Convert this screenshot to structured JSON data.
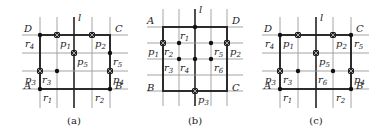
{
  "panels": [
    {
      "caption": "(a)",
      "line_label": "l",
      "corners": [
        {
          "name": "D",
          "at": "top-left"
        },
        {
          "name": "C",
          "at": "top-right"
        },
        {
          "name": "A",
          "at": "bottom-left"
        },
        {
          "name": "B",
          "at": "bottom-right"
        }
      ],
      "grid": {
        "cols": 5,
        "rows": 4,
        "l_col": 2
      },
      "rect": {
        "c0": 0,
        "c1": 4,
        "r0": 0,
        "r1": 3
      },
      "points": [
        {
          "label": "p",
          "sub": "1",
          "kind": "cross",
          "c": 1,
          "r": 0,
          "lx": 1,
          "ly": 1
        },
        {
          "label": "p",
          "sub": "2",
          "kind": "cross",
          "c": 3,
          "r": 0,
          "lx": 1,
          "ly": 1
        },
        {
          "label": "p",
          "sub": "5",
          "kind": "cross",
          "c": 2,
          "r": 1,
          "lx": 1,
          "ly": 1
        },
        {
          "label": "p",
          "sub": "3",
          "kind": "cross",
          "c": 0,
          "r": 2,
          "lx": -1,
          "ly": 1
        },
        {
          "label": "p",
          "sub": "4",
          "kind": "cross",
          "c": 4,
          "r": 2,
          "lx": 1,
          "ly": 1
        },
        {
          "label": "r",
          "sub": "4",
          "kind": "dot",
          "c": 0,
          "r": 0,
          "lx": -1,
          "ly": 1
        },
        {
          "label": "r",
          "sub": "5",
          "kind": "dot",
          "c": 4,
          "r": 1,
          "lx": 1,
          "ly": 1
        },
        {
          "label": "r",
          "sub": "3",
          "kind": "dot",
          "c": 1,
          "r": 2,
          "lx": -1,
          "ly": 1
        },
        {
          "label": "r",
          "sub": "1",
          "kind": "dot",
          "c": 0,
          "r": 3,
          "lx": 1,
          "ly": 1
        },
        {
          "label": "r",
          "sub": "2",
          "kind": "dot",
          "c": 4,
          "r": 3,
          "lx": -1,
          "ly": 1
        }
      ]
    },
    {
      "caption": "(b)",
      "line_label": "l",
      "corners": [
        {
          "name": "A",
          "at": "top-left"
        },
        {
          "name": "D",
          "at": "top-right"
        },
        {
          "name": "B",
          "at": "bottom-left"
        },
        {
          "name": "C",
          "at": "bottom-right"
        }
      ],
      "grid": {
        "cols": 5,
        "rows": 5,
        "l_col": 2
      },
      "rect": {
        "c0": 0,
        "c1": 4,
        "r0": 0,
        "r1": 4
      },
      "points": [
        {
          "label": "p",
          "sub": "1",
          "kind": "cross",
          "c": 0,
          "r": 1,
          "lx": -1,
          "ly": 1
        },
        {
          "label": "p",
          "sub": "2",
          "kind": "cross",
          "c": 4,
          "r": 1,
          "lx": 1,
          "ly": 1
        },
        {
          "label": "p",
          "sub": "3",
          "kind": "cross",
          "c": 2,
          "r": 4,
          "lx": 1,
          "ly": 1
        },
        {
          "label": "r",
          "sub": "1",
          "kind": "dot",
          "c": 2,
          "r": 0,
          "lx": -1,
          "ly": 1
        },
        {
          "label": "r",
          "sub": "2",
          "kind": "dot",
          "c": 1,
          "r": 1,
          "lx": -1,
          "ly": 1
        },
        {
          "label": "r",
          "sub": "5",
          "kind": "dot",
          "c": 3,
          "r": 1,
          "lx": 1,
          "ly": 1
        },
        {
          "label": "r",
          "sub": "3",
          "kind": "dot",
          "c": 1,
          "r": 2,
          "lx": -1,
          "ly": 1
        },
        {
          "label": "r",
          "sub": "4",
          "kind": "dot",
          "c": 2,
          "r": 2,
          "lx": -1,
          "ly": 1
        },
        {
          "label": "r",
          "sub": "6",
          "kind": "dot",
          "c": 3,
          "r": 2,
          "lx": 1,
          "ly": 1
        }
      ]
    },
    {
      "caption": "(c)",
      "line_label": "l",
      "corners": [
        {
          "name": "D",
          "at": "top-left"
        },
        {
          "name": "C",
          "at": "top-right"
        },
        {
          "name": "A",
          "at": "bottom-left"
        },
        {
          "name": "B",
          "at": "bottom-right"
        }
      ],
      "grid": {
        "cols": 5,
        "rows": 4,
        "l_col": 2
      },
      "rect": {
        "c0": 0,
        "c1": 4,
        "r0": 0,
        "r1": 3
      },
      "points": [
        {
          "label": "p",
          "sub": "1",
          "kind": "cross",
          "c": 1,
          "r": 0,
          "lx": -1,
          "ly": 1
        },
        {
          "label": "p",
          "sub": "2",
          "kind": "cross",
          "c": 3,
          "r": 0,
          "lx": 1,
          "ly": 1
        },
        {
          "label": "p",
          "sub": "5",
          "kind": "cross",
          "c": 2,
          "r": 1,
          "lx": 1,
          "ly": 1
        },
        {
          "label": "p",
          "sub": "3",
          "kind": "cross",
          "c": 0,
          "r": 2,
          "lx": -1,
          "ly": 1
        },
        {
          "label": "p",
          "sub": "4",
          "kind": "cross",
          "c": 4,
          "r": 2,
          "lx": 1,
          "ly": 1
        },
        {
          "label": "r",
          "sub": "4",
          "kind": "dot",
          "c": 0,
          "r": 0,
          "lx": -1,
          "ly": 1
        },
        {
          "label": "r",
          "sub": "5",
          "kind": "dot",
          "c": 4,
          "r": 0,
          "lx": 1,
          "ly": 1
        },
        {
          "label": "r",
          "sub": "3",
          "kind": "dot",
          "c": 1,
          "r": 2,
          "lx": -1,
          "ly": 1
        },
        {
          "label": "r",
          "sub": "6",
          "kind": "dot",
          "c": 3,
          "r": 2,
          "lx": -1,
          "ly": 1
        },
        {
          "label": "r",
          "sub": "1",
          "kind": "dot",
          "c": 0,
          "r": 3,
          "lx": 1,
          "ly": 1
        },
        {
          "label": "r",
          "sub": "2",
          "kind": "dot",
          "c": 4,
          "r": 3,
          "lx": -1,
          "ly": 1
        }
      ]
    }
  ]
}
